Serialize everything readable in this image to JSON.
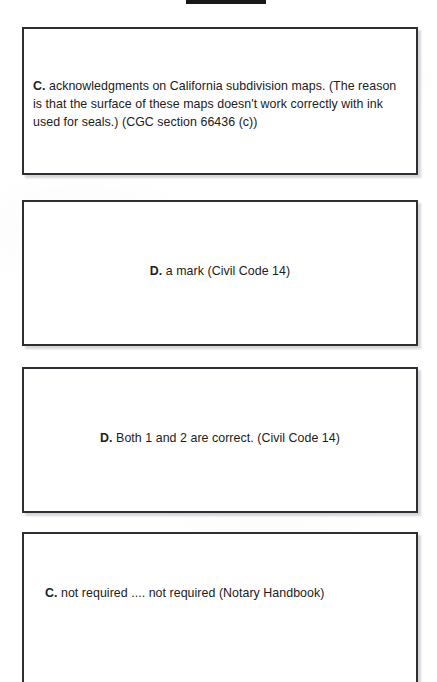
{
  "page": {
    "background_color": "#ffffff",
    "text_color": "#1d2022",
    "border_color": "#2c2f33",
    "redaction_bar_color": "#16181a"
  },
  "answers": [
    {
      "option": "C.",
      "text": " acknowledgments on California subdivision maps. (The reason is that the surface of these maps doesn't work correctly with ink used for seals.) (CGC section 66436 (c))"
    },
    {
      "option": "D.",
      "text": " a mark (Civil Code 14)"
    },
    {
      "option": "D.",
      "text": " Both 1 and 2 are correct. (Civil Code 14)"
    },
    {
      "option": "C.",
      "text": " not required .... not required (Notary Handbook)"
    }
  ]
}
